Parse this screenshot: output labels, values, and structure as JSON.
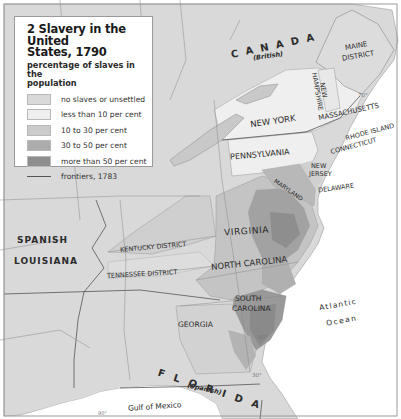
{
  "legend": {
    "title": "2 Slavery in the United States, 1790",
    "title_line1": "2 Slavery in the United",
    "title_line2": "States, 1790",
    "subtitle_line1": "percentage of slaves in the",
    "subtitle_line2": "population",
    "items": [
      {
        "label": "no slaves or unsettled",
        "color": "#d9d9d9"
      },
      {
        "label": "less than 10 per cent",
        "color": "#efefef"
      },
      {
        "label": "10 to 30 per cent",
        "color": "#cbcbcb"
      },
      {
        "label": "30 to 50 per cent",
        "color": "#acacac"
      },
      {
        "label": "more than 50 per cent",
        "color": "#8e8e8e"
      }
    ],
    "frontier_label": "frontiers, 1783"
  },
  "labels": {
    "canada": "C A N A D A",
    "canada_sub": "(British)",
    "maine_1": "MAINE",
    "maine_2": "DISTRICT",
    "new_hampshire_1": "NEW",
    "new_hampshire_2": "HAMPSHIRE",
    "massachusetts": "MASSACHUSETTS",
    "rhode_island": "RHODE ISLAND",
    "connecticut": "CONNECTICUT",
    "new_york": "NEW YORK",
    "pennsylvania": "PENNSYLVANIA",
    "new_jersey_1": "NEW",
    "new_jersey_2": "JERSEY",
    "delaware": "DELAWARE",
    "maryland": "MARYLAND",
    "virginia": "VIRGINIA",
    "north_carolina": "NORTH CAROLINA",
    "south_carolina_1": "SOUTH",
    "south_carolina_2": "CAROLINA",
    "georgia": "GEORGIA",
    "kentucky": "KENTUCKY DISTRICT",
    "tennessee": "TENNESSEE DISTRICT",
    "spanish_1": "SPANISH",
    "spanish_2": "LOUISIANA",
    "florida": "F L O R I D A",
    "florida_sub": "(Spanish)",
    "atlantic_1": "Atlantic",
    "atlantic_2": "Ocean",
    "gulf": "Gulf of Mexico",
    "lon_70": "70°",
    "lon_80": "80°",
    "lat_30": "30°",
    "lon_90": "90°"
  },
  "colors": {
    "land_unsettled": "#d9d9d9",
    "land_low": "#efefef",
    "land_mid": "#cbcbcb",
    "land_high": "#acacac",
    "land_top": "#8e8e8e",
    "water": "#ffffff",
    "frame": "#9a9a9a"
  }
}
